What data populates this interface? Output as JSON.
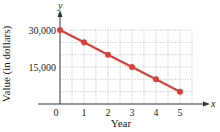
{
  "chart_data": {
    "type": "line",
    "title": "",
    "xlabel": "Year",
    "ylabel": "Value (in dollars)",
    "x_axis_symbol": "x",
    "y_axis_symbol": "y",
    "x": [
      0,
      1,
      2,
      3,
      4,
      5
    ],
    "series": [
      {
        "name": "Value",
        "values": [
          30000,
          25000,
          20000,
          15000,
          10000,
          5000
        ],
        "color": "#d9403a"
      }
    ],
    "x_ticks": [
      "0",
      "1",
      "2",
      "3",
      "4",
      "5"
    ],
    "y_ticks": [
      "15,000",
      "30,000"
    ],
    "xlim": [
      0,
      5.5
    ],
    "ylim": [
      0,
      35000
    ],
    "grid": true,
    "legend": null
  }
}
